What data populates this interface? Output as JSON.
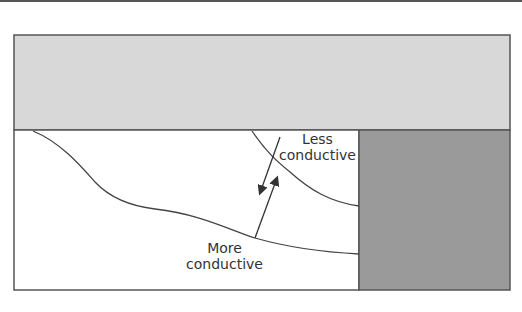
{
  "diagram": {
    "labels": {
      "less": [
        "Less",
        "conductive"
      ],
      "more": [
        "More",
        "conductive"
      ]
    },
    "colors": {
      "top_layer": "#d8d8d8",
      "right_block": "#9a9a9a",
      "lines": "#444444",
      "background": "#ffffff"
    }
  }
}
